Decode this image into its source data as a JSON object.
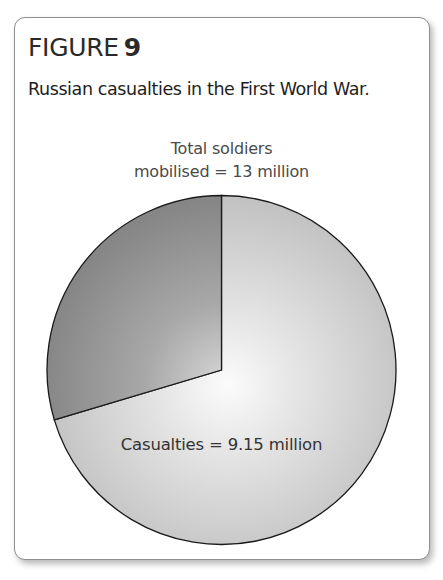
{
  "figure": {
    "label": "FIGURE",
    "number": "9",
    "caption": "Russian casualties in the First World War."
  },
  "labels": {
    "total_line1": "Total soldiers",
    "total_line2": "mobilised = 13 million",
    "casualties": "Casualties = 9.15 million"
  },
  "colors": {
    "card_border": "#8e8e8e",
    "slice_outline": "#1a1a1a",
    "casualties_edge": "#c2c2c2",
    "casualties_center": "#fbfbfb",
    "other_edge": "#868686",
    "other_center": "#d8d8d8"
  },
  "chart_data": {
    "type": "pie",
    "subtitle": "Russian casualties in the First World War.",
    "total": 13,
    "unit": "million",
    "total_label": "Total soldiers mobilised = 13 million",
    "slices": [
      {
        "name": "Casualties",
        "value": 9.15,
        "label": "Casualties = 9.15 million",
        "percent": 70.4,
        "shade": "light"
      },
      {
        "name": "Non-casualties (remaining mobilised soldiers)",
        "value": 3.85,
        "label": "",
        "percent": 29.6,
        "shade": "dark"
      }
    ],
    "start_angle_deg": 0,
    "direction": "casualties clockwise from 12 o'clock",
    "legend": "none (direct labels)"
  }
}
